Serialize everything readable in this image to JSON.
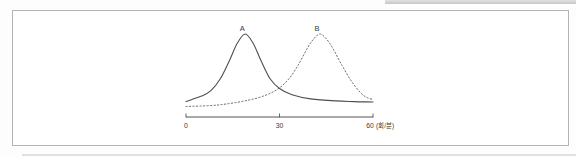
{
  "figure": {
    "panel": {
      "border_color": "#b3b3b3",
      "background": "#ffffff"
    }
  },
  "chart_data": {
    "type": "line",
    "title": "",
    "xlabel": "(회/분)",
    "ylabel": "",
    "x_ticks": [
      "0",
      "30",
      "60"
    ],
    "x_range": [
      0,
      60
    ],
    "y_range": [
      0,
      1
    ],
    "grid": false,
    "legend": "none",
    "axis_color": "#555555",
    "text_color": "#3a3a3a",
    "series": [
      {
        "name": "A",
        "label": "A",
        "line_style": "solid",
        "color": "#4f4f4f",
        "peak_x": 19,
        "x": [
          0,
          5,
          8,
          11,
          14,
          16.5,
          19,
          21.5,
          24,
          27,
          30,
          34,
          40,
          48,
          54,
          60
        ],
        "y": [
          0.02,
          0.1,
          0.18,
          0.35,
          0.62,
          0.87,
          1.0,
          0.87,
          0.62,
          0.35,
          0.21,
          0.12,
          0.06,
          0.03,
          0.02,
          0.015
        ]
      },
      {
        "name": "B",
        "label": "B",
        "line_style": "dotted",
        "color": "#5a5a5a",
        "peak_x": 43,
        "x": [
          0,
          10,
          20,
          26,
          30,
          33,
          36,
          39,
          41,
          43,
          45,
          47,
          50,
          53,
          56,
          58,
          60
        ],
        "y": [
          -0.05,
          -0.03,
          0.04,
          0.12,
          0.22,
          0.35,
          0.55,
          0.8,
          0.93,
          1.0,
          0.93,
          0.8,
          0.55,
          0.32,
          0.15,
          0.08,
          0.05
        ]
      }
    ]
  }
}
